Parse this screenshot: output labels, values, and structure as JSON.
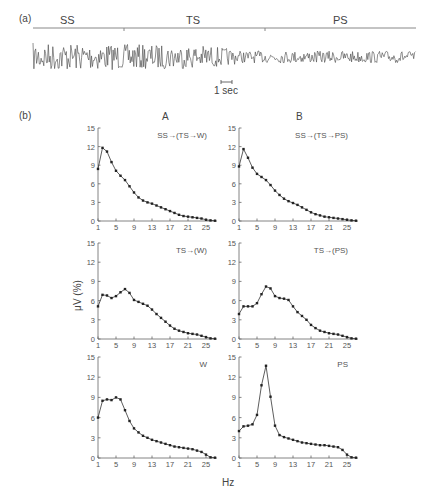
{
  "panel_a": {
    "label": "(a)",
    "stages": [
      "SS",
      "TS",
      "PS"
    ],
    "scale_bar": "1 sec"
  },
  "panel_b": {
    "label": "(b)",
    "columns": [
      "A",
      "B"
    ],
    "y_title": "μV (%)",
    "x_title": "Hz"
  },
  "chart_data": [
    {
      "type": "line",
      "column": "A",
      "row": 1,
      "title": "SS→(TS→W)",
      "xlabel": "Hz",
      "ylabel": "μV (%)",
      "ylim": [
        0,
        15
      ],
      "yticks": [
        0,
        3,
        6,
        9,
        12,
        15
      ],
      "xticks": [
        1,
        5,
        9,
        13,
        17,
        21,
        25
      ],
      "x": [
        1,
        2,
        3,
        4,
        5,
        6,
        7,
        8,
        9,
        10,
        11,
        12,
        13,
        14,
        15,
        16,
        17,
        18,
        19,
        20,
        21,
        22,
        23,
        24,
        25,
        26,
        27
      ],
      "values": [
        8.4,
        11.8,
        11.2,
        9.5,
        8.1,
        7.3,
        6.6,
        5.6,
        4.6,
        3.8,
        3.3,
        3.0,
        2.8,
        2.5,
        2.2,
        1.9,
        1.6,
        1.3,
        1.0,
        0.8,
        0.7,
        0.6,
        0.5,
        0.4,
        0.2,
        0.1,
        0.05
      ]
    },
    {
      "type": "line",
      "column": "B",
      "row": 1,
      "title": "SS→(TS→PS)",
      "xlabel": "Hz",
      "ylabel": "μV (%)",
      "ylim": [
        0,
        15
      ],
      "yticks": [
        0,
        3,
        6,
        9,
        12,
        15
      ],
      "xticks": [
        1,
        5,
        9,
        13,
        17,
        21,
        25
      ],
      "x": [
        1,
        2,
        3,
        4,
        5,
        6,
        7,
        8,
        9,
        10,
        11,
        12,
        13,
        14,
        15,
        16,
        17,
        18,
        19,
        20,
        21,
        22,
        23,
        24,
        25,
        26,
        27
      ],
      "values": [
        8.8,
        11.6,
        10.2,
        8.6,
        7.6,
        7.1,
        6.6,
        5.8,
        4.9,
        4.2,
        3.6,
        3.2,
        2.9,
        2.6,
        2.2,
        1.8,
        1.4,
        1.1,
        0.9,
        0.7,
        0.6,
        0.5,
        0.4,
        0.3,
        0.2,
        0.1,
        0.05
      ]
    },
    {
      "type": "line",
      "column": "A",
      "row": 2,
      "title": "TS→(W)",
      "xlabel": "Hz",
      "ylabel": "μV (%)",
      "ylim": [
        0,
        15
      ],
      "yticks": [
        0,
        3,
        6,
        9,
        12,
        15
      ],
      "xticks": [
        1,
        5,
        9,
        13,
        17,
        21,
        25
      ],
      "x": [
        1,
        2,
        3,
        4,
        5,
        6,
        7,
        8,
        9,
        10,
        11,
        12,
        13,
        14,
        15,
        16,
        17,
        18,
        19,
        20,
        21,
        22,
        23,
        24,
        25,
        26,
        27
      ],
      "values": [
        5.1,
        6.9,
        6.8,
        6.4,
        6.7,
        7.3,
        7.8,
        7.2,
        6.1,
        5.8,
        5.5,
        5.2,
        4.6,
        3.9,
        3.3,
        2.7,
        2.1,
        1.6,
        1.3,
        1.1,
        0.9,
        0.8,
        0.7,
        0.5,
        0.3,
        0.1,
        0.05
      ]
    },
    {
      "type": "line",
      "column": "B",
      "row": 2,
      "title": "TS→(PS)",
      "xlabel": "Hz",
      "ylabel": "μV (%)",
      "ylim": [
        0,
        15
      ],
      "yticks": [
        0,
        3,
        6,
        9,
        12,
        15
      ],
      "xticks": [
        1,
        5,
        9,
        13,
        17,
        21,
        25
      ],
      "x": [
        1,
        2,
        3,
        4,
        5,
        6,
        7,
        8,
        9,
        10,
        11,
        12,
        13,
        14,
        15,
        16,
        17,
        18,
        19,
        20,
        21,
        22,
        23,
        24,
        25,
        26,
        27
      ],
      "values": [
        3.9,
        5.1,
        5.1,
        5.1,
        5.6,
        7.0,
        8.2,
        7.9,
        6.7,
        6.4,
        6.3,
        6.1,
        5.1,
        4.2,
        3.6,
        3.0,
        2.2,
        1.7,
        1.3,
        1.1,
        0.9,
        0.8,
        0.7,
        0.5,
        0.3,
        0.1,
        0.05
      ]
    },
    {
      "type": "line",
      "column": "A",
      "row": 3,
      "title": "W",
      "xlabel": "Hz",
      "ylabel": "μV (%)",
      "ylim": [
        0,
        15
      ],
      "yticks": [
        0,
        3,
        6,
        9,
        12,
        15
      ],
      "xticks": [
        1,
        5,
        9,
        13,
        17,
        21,
        25
      ],
      "x": [
        1,
        2,
        3,
        4,
        5,
        6,
        7,
        8,
        9,
        10,
        11,
        12,
        13,
        14,
        15,
        16,
        17,
        18,
        19,
        20,
        21,
        22,
        23,
        24,
        25,
        26,
        27
      ],
      "values": [
        6.0,
        8.5,
        8.7,
        8.6,
        9.0,
        8.7,
        7.1,
        5.5,
        4.4,
        3.8,
        3.3,
        3.0,
        2.7,
        2.5,
        2.3,
        2.1,
        1.9,
        1.7,
        1.6,
        1.5,
        1.4,
        1.3,
        1.1,
        0.9,
        0.5,
        0.1,
        0.05
      ]
    },
    {
      "type": "line",
      "column": "B",
      "row": 3,
      "title": "PS",
      "xlabel": "Hz",
      "ylabel": "μV (%)",
      "ylim": [
        0,
        15
      ],
      "yticks": [
        0,
        3,
        6,
        9,
        12,
        15
      ],
      "xticks": [
        1,
        5,
        9,
        13,
        17,
        21,
        25
      ],
      "x": [
        1,
        2,
        3,
        4,
        5,
        6,
        7,
        8,
        9,
        10,
        11,
        12,
        13,
        14,
        15,
        16,
        17,
        18,
        19,
        20,
        21,
        22,
        23,
        24,
        25,
        26,
        27
      ],
      "values": [
        4.0,
        4.7,
        4.8,
        5.0,
        6.4,
        10.8,
        13.7,
        9.1,
        4.8,
        3.4,
        3.1,
        2.9,
        2.7,
        2.5,
        2.3,
        2.2,
        2.1,
        2.0,
        1.9,
        1.9,
        1.8,
        1.7,
        1.6,
        1.2,
        0.5,
        0.1,
        0.05
      ]
    }
  ]
}
